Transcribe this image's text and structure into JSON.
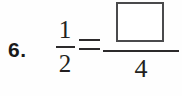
{
  "worksheet": {
    "problem_number": "6.",
    "equation": {
      "left_fraction": {
        "numerator": "1",
        "denominator": "2"
      },
      "relation": "=",
      "right_fraction": {
        "numerator": "",
        "numerator_is_blank_box": true,
        "denominator": "4"
      }
    }
  },
  "colors": {
    "background": "#fefefe",
    "ink": "#231f20",
    "box_border": "#4a4a4c"
  }
}
